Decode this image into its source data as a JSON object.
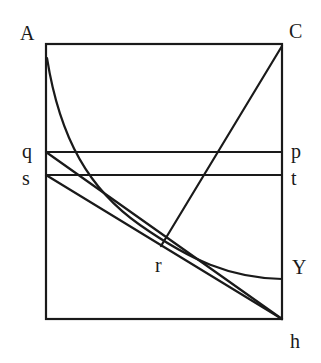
{
  "diagram": {
    "labels": {
      "A": "A",
      "C": "C",
      "q": "q",
      "p": "p",
      "s": "s",
      "t": "t",
      "r": "r",
      "Y": "Y",
      "h": "h"
    },
    "colors": {
      "ink": "#1a1a1a",
      "background": "#ffffff"
    }
  }
}
